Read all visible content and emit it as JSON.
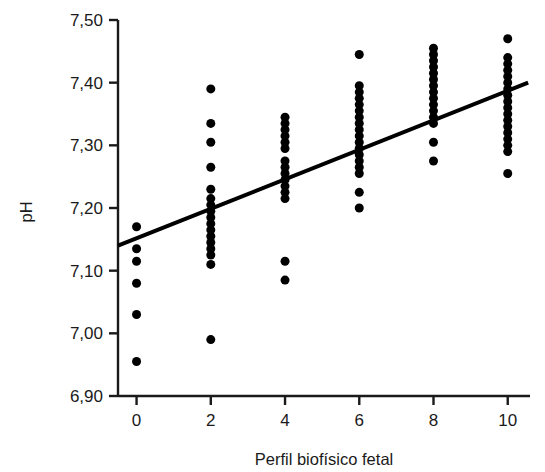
{
  "chart_data": {
    "type": "scatter",
    "title": "",
    "xlabel": "Perfil biofísico fetal",
    "ylabel": "pH",
    "xlim": [
      -0.5,
      10.6
    ],
    "ylim": [
      6.9,
      7.5
    ],
    "xticks": [
      0,
      2,
      4,
      6,
      8,
      10
    ],
    "xtick_labels": [
      "0",
      "2",
      "4",
      "6",
      "8",
      "10"
    ],
    "yticks": [
      6.9,
      7.0,
      7.1,
      7.2,
      7.3,
      7.4,
      7.5
    ],
    "ytick_labels": [
      "6,90",
      "7,00",
      "7,10",
      "7,20",
      "7,30",
      "7,40",
      "7,50"
    ],
    "decimal_separator": ",",
    "grid": false,
    "legend": null,
    "marker": "filled-circle",
    "marker_color": "#000000",
    "marker_size": 9,
    "axis_color": "#1a1a1a",
    "background_color": "#ffffff",
    "series": [
      {
        "name": "pH por perfil biofísico fetal",
        "points": [
          [
            0,
            7.17
          ],
          [
            0,
            7.135
          ],
          [
            0,
            7.115
          ],
          [
            0,
            7.08
          ],
          [
            0,
            7.03
          ],
          [
            0,
            6.955
          ],
          [
            2,
            7.39
          ],
          [
            2,
            7.335
          ],
          [
            2,
            7.305
          ],
          [
            2,
            7.265
          ],
          [
            2,
            7.23
          ],
          [
            2,
            7.215
          ],
          [
            2,
            7.205
          ],
          [
            2,
            7.195
          ],
          [
            2,
            7.185
          ],
          [
            2,
            7.175
          ],
          [
            2,
            7.165
          ],
          [
            2,
            7.155
          ],
          [
            2,
            7.145
          ],
          [
            2,
            7.135
          ],
          [
            2,
            7.125
          ],
          [
            2,
            7.11
          ],
          [
            2,
            6.99
          ],
          [
            4,
            7.345
          ],
          [
            4,
            7.335
          ],
          [
            4,
            7.325
          ],
          [
            4,
            7.315
          ],
          [
            4,
            7.305
          ],
          [
            4,
            7.295
          ],
          [
            4,
            7.275
          ],
          [
            4,
            7.265
          ],
          [
            4,
            7.255
          ],
          [
            4,
            7.245
          ],
          [
            4,
            7.235
          ],
          [
            4,
            7.225
          ],
          [
            4,
            7.215
          ],
          [
            4,
            7.115
          ],
          [
            4,
            7.085
          ],
          [
            6,
            7.445
          ],
          [
            6,
            7.395
          ],
          [
            6,
            7.385
          ],
          [
            6,
            7.375
          ],
          [
            6,
            7.365
          ],
          [
            6,
            7.355
          ],
          [
            6,
            7.345
          ],
          [
            6,
            7.335
          ],
          [
            6,
            7.325
          ],
          [
            6,
            7.315
          ],
          [
            6,
            7.305
          ],
          [
            6,
            7.295
          ],
          [
            6,
            7.285
          ],
          [
            6,
            7.275
          ],
          [
            6,
            7.265
          ],
          [
            6,
            7.255
          ],
          [
            6,
            7.225
          ],
          [
            6,
            7.2
          ],
          [
            8,
            7.455
          ],
          [
            8,
            7.445
          ],
          [
            8,
            7.435
          ],
          [
            8,
            7.425
          ],
          [
            8,
            7.415
          ],
          [
            8,
            7.405
          ],
          [
            8,
            7.395
          ],
          [
            8,
            7.385
          ],
          [
            8,
            7.375
          ],
          [
            8,
            7.365
          ],
          [
            8,
            7.355
          ],
          [
            8,
            7.345
          ],
          [
            8,
            7.335
          ],
          [
            8,
            7.305
          ],
          [
            8,
            7.275
          ],
          [
            10,
            7.47
          ],
          [
            10,
            7.44
          ],
          [
            10,
            7.43
          ],
          [
            10,
            7.42
          ],
          [
            10,
            7.41
          ],
          [
            10,
            7.4
          ],
          [
            10,
            7.39
          ],
          [
            10,
            7.38
          ],
          [
            10,
            7.37
          ],
          [
            10,
            7.36
          ],
          [
            10,
            7.35
          ],
          [
            10,
            7.34
          ],
          [
            10,
            7.33
          ],
          [
            10,
            7.32
          ],
          [
            10,
            7.31
          ],
          [
            10,
            7.3
          ],
          [
            10,
            7.29
          ],
          [
            10,
            7.255
          ]
        ]
      }
    ],
    "trendline": {
      "type": "linear-regression",
      "color": "#000000",
      "width": 4,
      "x_start": -0.5,
      "y_start": 7.14,
      "x_end": 10.55,
      "y_end": 7.4
    }
  }
}
